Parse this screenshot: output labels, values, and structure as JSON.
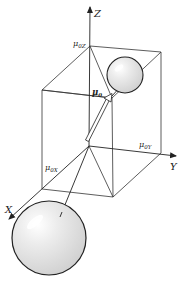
{
  "diagram": {
    "type": "3d-vector-decomposition",
    "axes": {
      "z_label": "Z",
      "y_label": "Y",
      "x_label": "X"
    },
    "components": {
      "mu_z": "μ0Z",
      "mu_y": "μ0Y",
      "mu_x": "μ0X",
      "mu_vector": "μ0"
    },
    "label_parts": {
      "mu_z_base": "μ",
      "mu_z_sub": "0Z",
      "mu_y_base": "μ",
      "mu_y_sub": "0Y",
      "mu_x_base": "μ",
      "mu_x_sub": "0X",
      "mu_vec_base": "μ",
      "mu_vec_sub": "0"
    },
    "objects": [
      {
        "name": "small-sphere",
        "description": "sphere at end of dipole vector, upper right"
      },
      {
        "name": "large-sphere",
        "description": "sphere at opposite end, lower left"
      },
      {
        "name": "dipole-arrow",
        "description": "hollow arrow from origin toward upper sphere"
      }
    ],
    "colors": {
      "line": "#333333",
      "sphere_fill": "#e4e4e4",
      "sphere_highlight": "#ffffff",
      "background": "#ffffff"
    }
  }
}
